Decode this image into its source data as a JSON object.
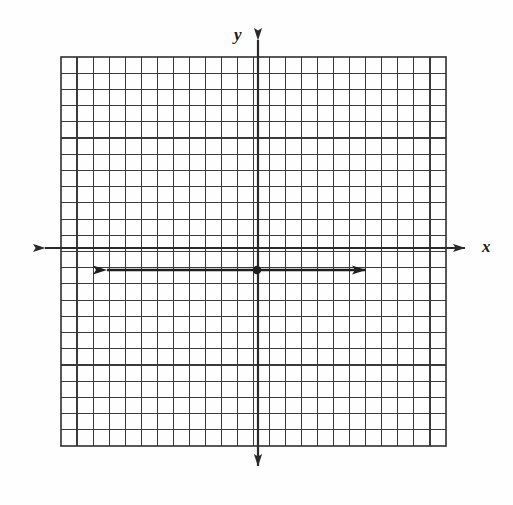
{
  "figure": {
    "kind": "coordinate-grid-worksheet",
    "background_color": "#fefefe",
    "ink_color": "#2a2a2a",
    "width": 513,
    "height": 505,
    "labels": {
      "y_axis": "y",
      "x_axis": "x"
    },
    "grid": {
      "left": 61,
      "top": 57,
      "right": 446,
      "bottom": 446,
      "columns": 24,
      "rows": 24,
      "cell_width": 16.05,
      "cell_height": 16.2,
      "line_color": "#3a3a3a",
      "line_width": 1.1,
      "border_width": 1.6
    },
    "y_axis": {
      "x": 258,
      "top_arrow_tip_y": 27,
      "bottom_arrow_tip_y": 479,
      "line_width": 2.2,
      "arrowheads": [
        "up",
        "down"
      ]
    },
    "x_axis": {
      "y": 248,
      "left_arrow_tip_x": 32,
      "right_arrow_tip_x": 478,
      "line_width": 2.2,
      "arrowheads": [
        "left",
        "right"
      ]
    },
    "graphed_line": {
      "description": "horizontal line with arrowheads at both ends",
      "y": 270,
      "left_arrow_tip_x": 93,
      "right_arrow_tip_x": 380,
      "line_width": 2.4,
      "arrowheads": [
        "left",
        "right"
      ]
    },
    "origin_point": {
      "x": 257,
      "y": 270,
      "radius": 4.2
    }
  },
  "chart_data": {
    "type": "line",
    "title": "",
    "xlabel": "x",
    "ylabel": "y",
    "grid": true,
    "legend": "none",
    "xlim": [
      -12,
      12
    ],
    "ylim": [
      -12,
      12
    ],
    "x_tick_step": 1,
    "y_tick_step": 1,
    "series": [
      {
        "name": "horizontal line",
        "equation": "y = -1",
        "x": [
          -10,
          8
        ],
        "values": [
          -1,
          -1
        ],
        "arrowheads_both_ends": true
      }
    ],
    "points": [
      {
        "label": "",
        "x": 0,
        "y": -1
      }
    ],
    "annotations": []
  }
}
